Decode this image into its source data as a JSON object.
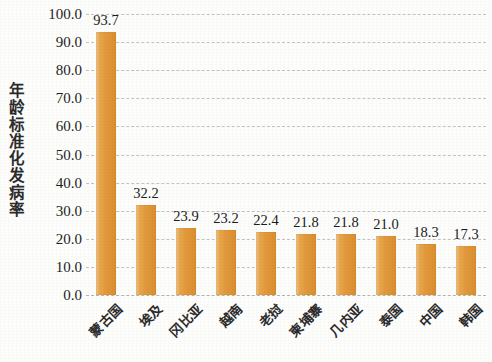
{
  "chart_data": {
    "type": "bar",
    "title": "",
    "subtitle": "",
    "xlabel": "",
    "ylabel": "年龄标准化发病率",
    "categories": [
      "蒙古国",
      "埃及",
      "冈比亚",
      "越南",
      "老挝",
      "柬埔寨",
      "几内亚",
      "泰国",
      "中国",
      "韩国"
    ],
    "values": [
      93.7,
      32.2,
      23.9,
      23.2,
      22.4,
      21.8,
      21.8,
      21.0,
      18.3,
      17.3
    ],
    "value_labels": [
      "93.7",
      "32.2",
      "23.9",
      "23.2",
      "22.4",
      "21.8",
      "21.8",
      "21.0",
      "18.3",
      "17.3"
    ],
    "ylim": [
      0.0,
      100.0
    ],
    "ytick_step": 10.0,
    "ytick_labels": [
      "100.0",
      "90.0",
      "80.0",
      "70.0",
      "60.0",
      "50.0",
      "40.0",
      "30.0",
      "20.0",
      "10.0",
      "0.0"
    ],
    "ytick_values": [
      100.0,
      90.0,
      80.0,
      70.0,
      60.0,
      50.0,
      40.0,
      30.0,
      20.0,
      10.0,
      0.0
    ],
    "grid": true,
    "grid_style": "dashed",
    "legend": false,
    "legend_position": "none",
    "bar_color": "#e2993c",
    "grid_color": "#c3c3c3",
    "text_color": "#1d1d1d",
    "background_color": "#fdfdfc"
  }
}
